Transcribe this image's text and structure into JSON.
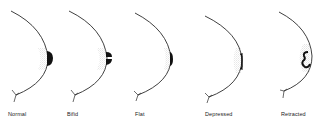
{
  "diagram": {
    "colors": {
      "line": "#2a2a2a",
      "fill": "#111111",
      "shade": "#9a9a9a",
      "background": "#ffffff"
    },
    "figures": [
      {
        "id": "normal",
        "label": "Normal",
        "label_x": 8
      },
      {
        "id": "bifid",
        "label": "Bifid",
        "label_x": 67
      },
      {
        "id": "flat",
        "label": "Flat",
        "label_x": 135
      },
      {
        "id": "depressed",
        "label": "Depressed",
        "label_x": 205
      },
      {
        "id": "retracted",
        "label": "Retracted",
        "label_x": 281
      }
    ]
  }
}
